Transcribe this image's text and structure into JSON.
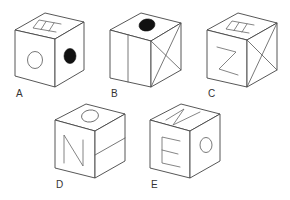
{
  "diagram": {
    "type": "cube-net-options",
    "background": "#ffffff",
    "stroke_color": "#444444",
    "options": [
      {
        "label": "A",
        "top": "E-glyph (rotated)",
        "front": "open-circle",
        "right": "filled-circle"
      },
      {
        "label": "B",
        "top": "filled-circle",
        "front": "vertical-line",
        "right": "X-diagonals"
      },
      {
        "label": "C",
        "top": "E-glyph (rotated)",
        "front": "Z-glyph",
        "right": "X-diagonals"
      },
      {
        "label": "D",
        "top": "open-circle",
        "front": "N-glyph",
        "right": "horizontal-line"
      },
      {
        "label": "E",
        "top": "N-glyph (rotated)",
        "front": "E-glyph",
        "right": "open-circle"
      }
    ]
  }
}
